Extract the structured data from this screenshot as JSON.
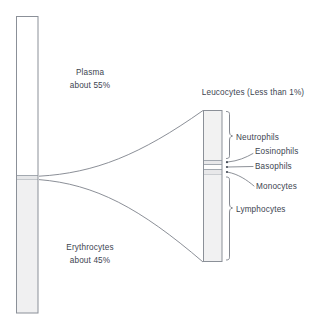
{
  "figure": {
    "labels": {
      "plasma_name": "Plasma",
      "plasma_amount": "about 55%",
      "erythrocytes_name": "Erythrocytes",
      "erythrocytes_amount": "about 45%",
      "leucocytes_header": "Leucocytes (Less than 1%)"
    },
    "blood_tube": {
      "name": "blood-sample-tube",
      "layers": [
        {
          "key": "plasma",
          "label": "Plasma",
          "percent": 55,
          "fill": "#ffffff"
        },
        {
          "key": "buffy_coat",
          "label": "Leucocytes",
          "percent": 1,
          "fill": "#e6e7e9"
        },
        {
          "key": "erythrocytes",
          "label": "Erythrocytes",
          "percent": 45,
          "fill": "#f0f0f1"
        }
      ]
    },
    "leucocyte_tube": {
      "name": "leucocyte-detail-tube",
      "bands": [
        {
          "key": "neutrophils",
          "label": "Neutrophils"
        },
        {
          "key": "eosinophils",
          "label": "Eosinophils"
        },
        {
          "key": "basophils",
          "label": "Basophils"
        },
        {
          "key": "monocytes",
          "label": "Monocytes"
        },
        {
          "key": "lymphocytes",
          "label": "Lymphocytes"
        }
      ]
    },
    "colors": {
      "outline": "#8b9098",
      "text": "#3d4450",
      "erythrocyte_fill": "#f0f0f1",
      "plasma_fill": "#ffffff",
      "leucocyte_fill": "#f2f2f2",
      "connector": "#767b84"
    }
  }
}
